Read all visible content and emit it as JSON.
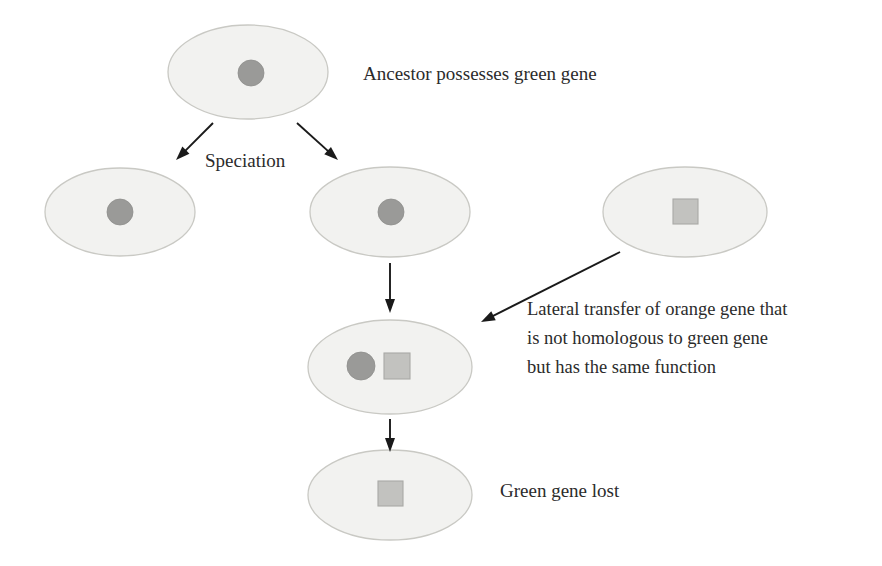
{
  "figure": {
    "background_color": "#ffffff",
    "text_color": "#2b2b2b",
    "cell_fill_color": "#f2f2f0",
    "cell_border_color": "#c9c9c4",
    "green_gene_color": "#9a9a98",
    "orange_gene_color": "#c2c2bf",
    "arrow_color": "#1a1a1a"
  },
  "labels": {
    "ancestor": "Ancestor possesses green gene",
    "speciation": "Speciation",
    "lateral_transfer_line1": "Lateral transfer of orange gene that",
    "lateral_transfer_line2": "is not homologous to green gene",
    "lateral_transfer_line3": "but has the same function",
    "green_gene_lost": "Green gene lost"
  },
  "cells": [
    {
      "id": "ancestor-cell",
      "name": "ancestor-cell",
      "cx": 248,
      "cy": 72,
      "rx": 80,
      "ry": 47,
      "genes": [
        {
          "type": "green-gene",
          "shape": "circle",
          "cx": 251,
          "cy": 73,
          "r": 13
        }
      ]
    },
    {
      "id": "left-descendant-cell",
      "name": "left-descendant-cell",
      "cx": 120,
      "cy": 212,
      "rx": 75,
      "ry": 44,
      "genes": [
        {
          "type": "green-gene",
          "shape": "circle",
          "cx": 120,
          "cy": 212,
          "r": 13
        }
      ]
    },
    {
      "id": "middle-descendant-cell",
      "name": "middle-descendant-cell",
      "cx": 390,
      "cy": 212,
      "rx": 80,
      "ry": 45,
      "genes": [
        {
          "type": "green-gene",
          "shape": "circle",
          "cx": 391,
          "cy": 212,
          "r": 13
        }
      ]
    },
    {
      "id": "donor-cell",
      "name": "donor-cell",
      "cx": 685,
      "cy": 212,
      "rx": 82,
      "ry": 45,
      "genes": [
        {
          "type": "orange-gene",
          "shape": "square",
          "x": 673,
          "y": 199,
          "size": 25
        }
      ]
    },
    {
      "id": "hybrid-cell",
      "name": "hybrid-cell",
      "cx": 390,
      "cy": 367,
      "rx": 82,
      "ry": 47,
      "genes": [
        {
          "type": "green-gene",
          "shape": "circle",
          "cx": 361,
          "cy": 366,
          "r": 14
        },
        {
          "type": "orange-gene",
          "shape": "square",
          "x": 384,
          "y": 353,
          "size": 26
        }
      ]
    },
    {
      "id": "final-cell",
      "name": "final-cell",
      "cx": 390,
      "cy": 495,
      "rx": 82,
      "ry": 45,
      "genes": [
        {
          "type": "orange-gene",
          "shape": "square",
          "x": 378,
          "y": 481,
          "size": 25
        }
      ]
    }
  ],
  "arrows": [
    {
      "id": "speciation-arrow-left",
      "name": "speciation-arrow-left",
      "x1": 213,
      "y1": 123,
      "x2": 176,
      "y2": 160
    },
    {
      "id": "speciation-arrow-right",
      "name": "speciation-arrow-right",
      "x1": 297,
      "y1": 123,
      "x2": 338,
      "y2": 160
    },
    {
      "id": "descent-arrow-upper",
      "name": "descent-arrow-upper",
      "x1": 390,
      "y1": 263,
      "x2": 390,
      "y2": 313
    },
    {
      "id": "lateral-transfer-arrow",
      "name": "lateral-transfer-arrow",
      "x1": 620,
      "y1": 252,
      "x2": 481,
      "y2": 322
    },
    {
      "id": "descent-arrow-lower",
      "name": "descent-arrow-lower",
      "x1": 390,
      "y1": 419,
      "x2": 390,
      "y2": 452
    }
  ],
  "text_positions": {
    "ancestor": {
      "x": 363,
      "y": 80
    },
    "speciation": {
      "x": 205,
      "y": 167
    },
    "lateral_transfer": {
      "x": 527,
      "y": 315,
      "line_height": 29
    },
    "green_gene_lost": {
      "x": 500,
      "y": 497
    }
  }
}
